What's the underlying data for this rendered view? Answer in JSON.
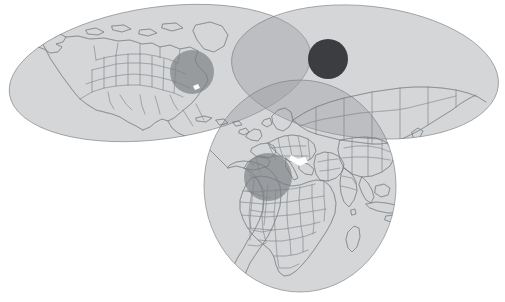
{
  "figure": {
    "title": "World map with three overlapping regional coverage ellipses",
    "background_color": "#ffffff",
    "width": 505,
    "height": 302,
    "map_projection_hint": "equirectangular world outline, country borders drawn"
  },
  "palette": {
    "ellipse_fill": "#9a9da1",
    "ellipse_stroke": "#75797e",
    "ellipse_opacity": "0.42",
    "circle_light": "#7f8387",
    "circle_dark": "#2f3134",
    "coastline": "#6e7378",
    "border": "#7b8085",
    "white_gap": "#ffffff"
  },
  "chart_data": {
    "type": "scatter",
    "title": "World map with three overlapping regional coverage ellipses",
    "xlabel": "",
    "ylabel": "",
    "xlim": [
      0,
      505
    ],
    "ylim": [
      0,
      302
    ],
    "grid": false,
    "legend_position": "none",
    "series": [
      {
        "name": "coverage-ellipses",
        "shape": "ellipse",
        "values": [
          {
            "label": "americas-ellipse",
            "cx": 160,
            "cy": 73,
            "rx": 152,
            "ry": 66,
            "rotation_deg": -8,
            "fill": "#9a9da1",
            "opacity": 0.42
          },
          {
            "label": "asia-pacific-ellipse",
            "cx": 365,
            "cy": 72,
            "rx": 134,
            "ry": 66,
            "rotation_deg": 6,
            "fill": "#9a9da1",
            "opacity": 0.42
          },
          {
            "label": "europe-africa-ellipse",
            "cx": 300,
            "cy": 186,
            "rx": 96,
            "ry": 106,
            "rotation_deg": 0,
            "fill": "#9a9da1",
            "opacity": 0.42
          }
        ]
      },
      {
        "name": "highlight-circles",
        "shape": "circle",
        "values": [
          {
            "label": "eastern-us-circle",
            "cx": 192,
            "cy": 72,
            "r": 22,
            "fill": "#7f8387",
            "tone": "light"
          },
          {
            "label": "east-asia-circle",
            "cx": 328,
            "cy": 59,
            "r": 20,
            "fill": "#2f3134",
            "tone": "dark"
          },
          {
            "label": "western-europe-circle",
            "cx": 268,
            "cy": 177,
            "r": 24,
            "fill": "#7f8387",
            "tone": "light"
          }
        ]
      }
    ],
    "annotations": [
      {
        "label": "white-data-gap",
        "x": 300,
        "y": 160,
        "note": "small white void near eastern mediterranean"
      },
      {
        "label": "white-data-gap-2",
        "x": 196,
        "y": 88,
        "note": "small white void near florida"
      }
    ]
  },
  "regions": [
    {
      "id": "americas",
      "name": "Americas"
    },
    {
      "id": "asia-pacific",
      "name": "Asia-Pacific"
    },
    {
      "id": "europe-africa",
      "name": "Europe & Africa"
    }
  ]
}
